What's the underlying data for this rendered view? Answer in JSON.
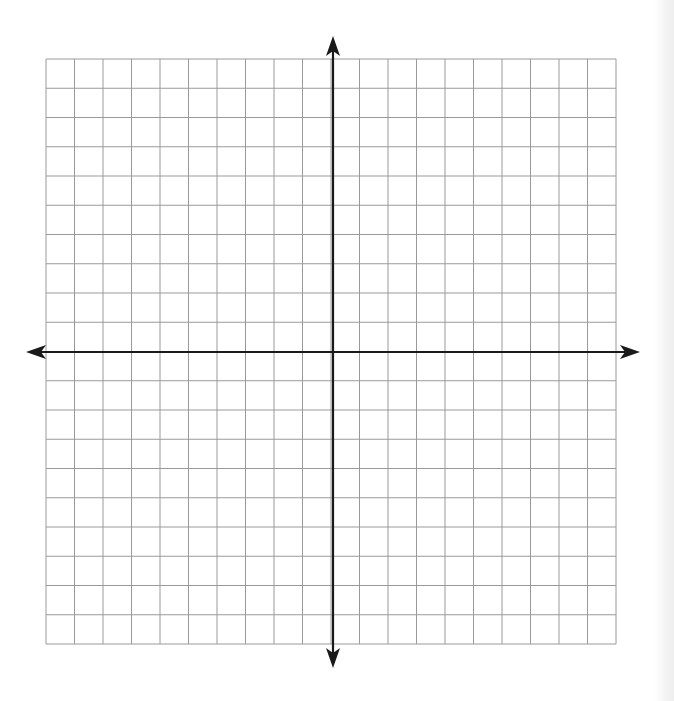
{
  "diagram": {
    "type": "coordinate-grid",
    "grid": {
      "left": 46,
      "top": 59,
      "right": 616,
      "bottom": 644,
      "columns": 20,
      "rows": 20,
      "line_color": "#9a9a9a"
    },
    "axes": {
      "x_axis_y": 352,
      "y_axis_x": 333,
      "x_start": 26,
      "x_end": 640,
      "y_start": 36,
      "y_end": 668,
      "color": "#1a1a1a"
    },
    "labels": []
  }
}
